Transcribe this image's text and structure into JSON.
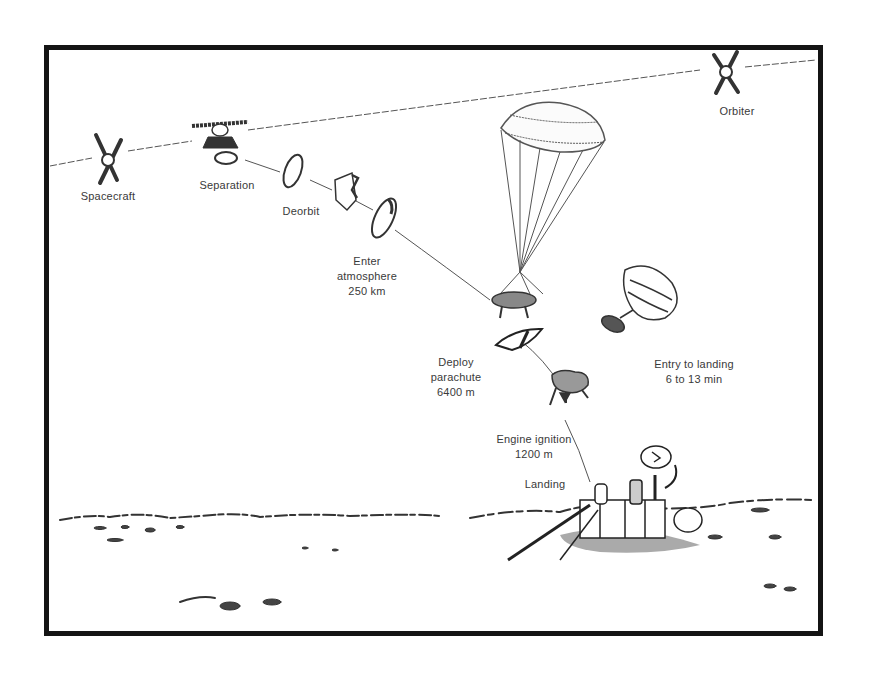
{
  "diagram": {
    "stages": [
      {
        "id": "spacecraft",
        "lines": [
          "Spacecraft"
        ]
      },
      {
        "id": "separation",
        "lines": [
          "Separation"
        ]
      },
      {
        "id": "deorbit",
        "lines": [
          "Deorbit"
        ]
      },
      {
        "id": "enter-atmosphere",
        "lines": [
          "Enter",
          "atmosphere",
          "250 km"
        ]
      },
      {
        "id": "deploy-parachute",
        "lines": [
          "Deploy",
          "parachute",
          "6400 m"
        ]
      },
      {
        "id": "engine-ignition",
        "lines": [
          "Engine ignition",
          "1200 m"
        ]
      },
      {
        "id": "landing",
        "lines": [
          "Landing"
        ]
      },
      {
        "id": "orbiter",
        "lines": [
          "Orbiter"
        ]
      }
    ],
    "annotation": {
      "lines": [
        "Entry to landing",
        "6 to 13 min"
      ]
    },
    "colors": {
      "ink": "#2a2a2a",
      "frame": "#141414",
      "background": "#ffffff",
      "label": "#3a3a3a"
    }
  }
}
